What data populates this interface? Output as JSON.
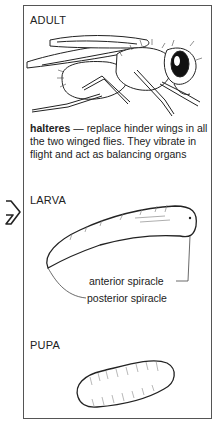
{
  "stages": {
    "adult": {
      "heading": "ADULT",
      "illustration": "adult-fly-illustration",
      "term": "halteres",
      "dash": " — ",
      "definition": "replace hinder wings in all the two winged flies. They vibrate in flight and act as balancing organs"
    },
    "larva": {
      "heading": "LARVA",
      "illustration": "larva-illustration",
      "labels": {
        "anterior": "anterior spiracle",
        "posterior": "posterior spiracle"
      }
    },
    "pupa": {
      "heading": "PUPA",
      "illustration": "pupa-illustration"
    }
  },
  "side_marker": {
    "icon": "outline-arrow-right-icon"
  }
}
